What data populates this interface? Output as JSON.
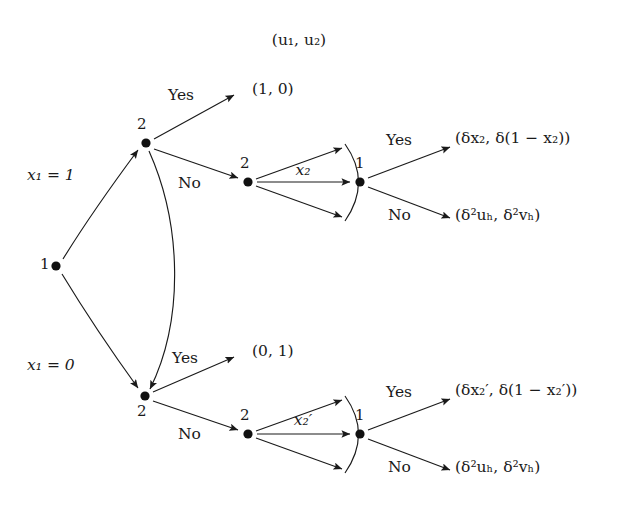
{
  "figure": {
    "type": "extensive-form-game-tree",
    "header_label": "(u₁, u₂)",
    "background_color": "#ffffff",
    "ink_color": "#1a1a1a"
  },
  "nodes": {
    "root": {
      "player": "1",
      "x": 56,
      "y": 266
    },
    "upper_responder": {
      "player": "2",
      "x": 146,
      "y": 143
    },
    "upper_proposer2": {
      "player": "2",
      "x": 248,
      "y": 182
    },
    "upper_responder1": {
      "player": "1",
      "x": 360,
      "y": 182
    },
    "lower_responder": {
      "player": "2",
      "x": 145,
      "y": 396
    },
    "lower_proposer2": {
      "player": "2",
      "x": 248,
      "y": 434
    },
    "lower_responder1": {
      "player": "1",
      "x": 360,
      "y": 434
    }
  },
  "edges": {
    "root_to_upper": {
      "label": "x₁ = 1"
    },
    "root_to_lower": {
      "label": "x₁ = 0"
    },
    "upper_yes": {
      "label": "Yes"
    },
    "upper_no": {
      "label": "No"
    },
    "upper_curve_no": {
      "label": "No"
    },
    "lower_yes_from_curve": {
      "label": "Yes"
    },
    "lower_yes": {
      "label": "Yes"
    },
    "lower_no": {
      "label": "No"
    },
    "upper_offer": {
      "label": "x₂"
    },
    "lower_offer": {
      "label": "x₂′"
    },
    "upper_accept": {
      "label": "Yes"
    },
    "upper_reject": {
      "label": "No"
    },
    "lower_accept": {
      "label": "Yes"
    },
    "lower_reject": {
      "label": "No"
    }
  },
  "payoffs": {
    "upper_accept_first": "(1, 0)",
    "lower_accept_first": "(0, 1)",
    "upper_accept_second": "(δx₂, δ(1 − x₂))",
    "upper_reject_second": "(δ²uₕ, δ²vₕ)",
    "lower_accept_second": "(δx₂′, δ(1 − x₂′))",
    "lower_reject_second": "(δ²uₕ, δ²vₕ)"
  }
}
